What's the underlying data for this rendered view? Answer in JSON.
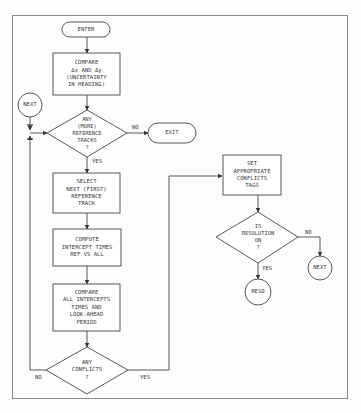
{
  "diagram": {
    "type": "flowchart",
    "nodes": {
      "enter": {
        "shape": "terminal",
        "label": "ENTER"
      },
      "compare_heading": {
        "shape": "process",
        "lines": [
          "COMPARE",
          "Δẋ AND Δẏ",
          "(UNCERTAINTY",
          "IN HEADING)"
        ]
      },
      "next_connector_left": {
        "shape": "connector",
        "label": "NEXT"
      },
      "any_more_ref": {
        "shape": "decision",
        "lines": [
          "ANY",
          "(MORE)",
          "REFERENCE",
          "TRACKS",
          "?"
        ]
      },
      "exit": {
        "shape": "terminal",
        "label": "EXIT"
      },
      "select_next": {
        "shape": "process",
        "lines": [
          "SELECT",
          "NEXT (FIRST)",
          "REFERENCE",
          "TRACK"
        ]
      },
      "compute_intercept": {
        "shape": "process",
        "lines": [
          "COMPUTE",
          "INTERCEPT TIMES",
          "REF VS ALL"
        ]
      },
      "compare_intercepts": {
        "shape": "process",
        "lines": [
          "COMPARE",
          "ALL INTERCEPTS",
          "TIMES AND",
          "LOOK-AHEAD",
          "PERIOD"
        ]
      },
      "any_conflicts": {
        "shape": "decision",
        "lines": [
          "ANY",
          "CONFLICTS",
          "?"
        ]
      },
      "set_tags": {
        "shape": "process",
        "lines": [
          "SET",
          "APPROPRIATE",
          "CONFLICTS",
          "TAGS"
        ]
      },
      "is_resolution_on": {
        "shape": "decision",
        "lines": [
          "IS",
          "RESOLUTION",
          "ON",
          "?"
        ]
      },
      "reso_connector": {
        "shape": "connector",
        "label": "RESO"
      },
      "next_connector_right": {
        "shape": "connector",
        "label": "NEXT"
      }
    },
    "edge_labels": {
      "more_ref_no": "NO",
      "more_ref_yes": "YES",
      "conflicts_no": "NO",
      "conflicts_yes": "YES",
      "resolution_no": "NO",
      "resolution_yes": "YES"
    },
    "edges": [
      {
        "from": "enter",
        "to": "compare_heading"
      },
      {
        "from": "compare_heading",
        "to": "any_more_ref"
      },
      {
        "from": "next_connector_left",
        "to": "any_more_ref"
      },
      {
        "from": "any_more_ref",
        "to": "exit",
        "label": "NO"
      },
      {
        "from": "any_more_ref",
        "to": "select_next",
        "label": "YES"
      },
      {
        "from": "select_next",
        "to": "compute_intercept"
      },
      {
        "from": "compute_intercept",
        "to": "compare_intercepts"
      },
      {
        "from": "compare_intercepts",
        "to": "any_conflicts"
      },
      {
        "from": "any_conflicts",
        "to": "any_more_ref",
        "label": "NO"
      },
      {
        "from": "any_conflicts",
        "to": "set_tags",
        "label": "YES"
      },
      {
        "from": "set_tags",
        "to": "is_resolution_on"
      },
      {
        "from": "is_resolution_on",
        "to": "next_connector_right",
        "label": "NO"
      },
      {
        "from": "is_resolution_on",
        "to": "reso_connector",
        "label": "YES"
      }
    ],
    "colors": {
      "line": "#444444",
      "frame": "#777777",
      "text": "#3a3a3a"
    }
  }
}
